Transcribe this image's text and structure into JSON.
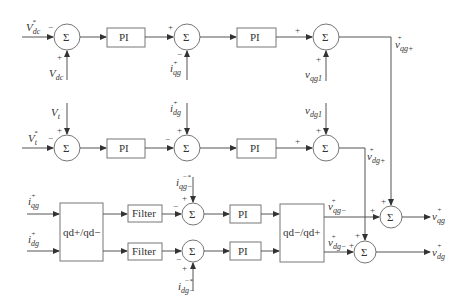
{
  "diagram": {
    "type": "control-block-diagram",
    "blocks": {
      "pi_label": "PI",
      "filter_label": "Filter",
      "sum_symbol": "Σ",
      "transform_fwd": "qd+/qd−",
      "transform_inv": "qd−/qd+"
    },
    "signs": {
      "plus": "+",
      "minus": "−"
    },
    "inputs": {
      "vdc_ref": {
        "main": "V",
        "sub": "dc",
        "sup": "*"
      },
      "vdc": {
        "main": "V",
        "sub": "dc",
        "sup": ""
      },
      "vt": {
        "main": "V",
        "sub": "t",
        "sup": ""
      },
      "vt_ref": {
        "main": "V",
        "sub": "t",
        "sup": "*"
      },
      "iqg_plus_ref": {
        "main": "i",
        "sub": "qg",
        "sup": "+"
      },
      "idg_plus_ref": {
        "main": "i",
        "sub": "dg",
        "sup": "+"
      },
      "vqg1": {
        "main": "v",
        "sub": "qg1",
        "sup": ""
      },
      "vdg1": {
        "main": "v",
        "sub": "dg1",
        "sup": ""
      },
      "iqg_plus": {
        "main": "i",
        "sub": "qg",
        "sup": "+"
      },
      "idg_plus": {
        "main": "i",
        "sub": "dg",
        "sup": "+"
      },
      "iqg_minus_ref": {
        "main": "i",
        "sub": "qg−",
        "sup": "−*"
      },
      "idg_minus_ref": {
        "main": "i",
        "sub": "dg−",
        "sup": "−*"
      }
    },
    "intermediate": {
      "vqg_plus": {
        "main": "v",
        "sub": "qg+",
        "sup": "+"
      },
      "vdg_plus": {
        "main": "v",
        "sub": "dg+",
        "sup": "+"
      },
      "vqg_minus": {
        "main": "v",
        "sub": "qg−",
        "sup": "+"
      },
      "vdg_minus": {
        "main": "v",
        "sub": "dg−",
        "sup": "+"
      }
    },
    "outputs": {
      "vqg": {
        "main": "v",
        "sub": "qg",
        "sup": "+"
      },
      "vdg": {
        "main": "v",
        "sub": "dg",
        "sup": "+"
      }
    }
  }
}
